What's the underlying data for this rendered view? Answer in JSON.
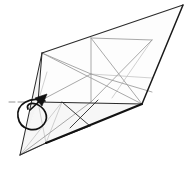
{
  "figure": {
    "background_color": "#ffffff"
  },
  "palette": {
    "paper_fill": "#fdfdfd",
    "paper_fill_shade": "#f6f6f6",
    "outline_dark": "#1a1a1a",
    "outline_mid": "#555555",
    "crease_light": "#9a9a9a",
    "crease_faint": "#bdbdbd",
    "arrow_color": "#111111",
    "tick_color": "#777777"
  },
  "stroke_widths": {
    "heavy_edge": 2.2,
    "outline": 1.1,
    "crease": 0.8,
    "faint_crease": 0.7,
    "arrow": 1.6
  },
  "vertices": {
    "top_apex": [
      183,
      5
    ],
    "upper_left": [
      42,
      53
    ],
    "left_mid": [
      38,
      102
    ],
    "bottom_left_point": [
      20,
      155
    ],
    "bottom_mid": [
      46,
      143
    ],
    "right_vertex": [
      142,
      104
    ],
    "ridge_top": [
      91,
      38
    ],
    "ridge_bottom": [
      91,
      102
    ],
    "lower_apex": [
      90,
      126
    ]
  },
  "shapes": {
    "paper_outline": "183,5 42,53 20,155 46,143 142,104",
    "upper_panel": "42,53 183,5 142,104 38,102",
    "lower_panel": "38,102 142,104 46,143 20,155"
  },
  "creases": [
    {
      "name": "ridge-vertical",
      "d": "M91,38 L91,102"
    },
    {
      "name": "upper-horizontal",
      "d": "M91,38 L152,40"
    },
    {
      "name": "mid-horizontal",
      "d": "M38,102 L142,104"
    },
    {
      "name": "diagonal-upper-right",
      "d": "M91,38 L142,104"
    },
    {
      "name": "diagonal-upper-left",
      "d": "M42,53 L142,104"
    },
    {
      "name": "diagonal-cross-a",
      "d": "M152,40 L91,102"
    },
    {
      "name": "diagonal-cross-b",
      "d": "M152,40 L112,98"
    },
    {
      "name": "long-shallow-right",
      "d": "M91,74 L152,92"
    },
    {
      "name": "long-shallow-right-2",
      "d": "M91,74 L152,78"
    },
    {
      "name": "upper-left-short",
      "d": "M42,53 L91,74"
    },
    {
      "name": "left-fan-a",
      "d": "M38,102 L91,74"
    },
    {
      "name": "left-side-fold",
      "d": "M42,53 L38,102"
    },
    {
      "name": "left-thin-fold",
      "d": "M47,72 L38,102"
    },
    {
      "name": "lower-x-left",
      "d": "M62,102 L90,126"
    },
    {
      "name": "lower-x-right",
      "d": "M98,100 L70,128"
    },
    {
      "name": "lower-apex-to-right",
      "d": "M90,126 L142,104"
    },
    {
      "name": "lower-apex-to-bl",
      "d": "M90,126 L46,143"
    },
    {
      "name": "bottom-fan-a",
      "d": "M20,155 L91,102"
    },
    {
      "name": "bottom-fan-b",
      "d": "M20,155 L62,102"
    },
    {
      "name": "bottom-fan-c",
      "d": "M20,155 L46,143"
    },
    {
      "name": "bottom-fan-d",
      "d": "M46,143 L38,102"
    },
    {
      "name": "bottom-fan-e",
      "d": "M46,143 L62,102"
    }
  ],
  "heavy_edges": [
    {
      "name": "bottom-heavy-edge",
      "d": "M46,143 L142,104"
    },
    {
      "name": "right-heavy-edge",
      "d": "M142,104 L183,5"
    }
  ],
  "arrow": {
    "name": "fold-over-loop-arrow",
    "loop_path": "M45,101 C30,96 16,104 18,117 C20,130 36,134 44,124 C50,116 44,107 36,104 C30,102 26,105 28,109",
    "head_shaft": "M30,110 L46,96",
    "head_points": "46,96 36,99 41,106",
    "label": ""
  },
  "tick_marks": [
    {
      "name": "guide-tick-left",
      "d": "M9,102 L15,102"
    },
    {
      "name": "guide-tick-left-2",
      "d": "M18,102 L24,102"
    }
  ]
}
